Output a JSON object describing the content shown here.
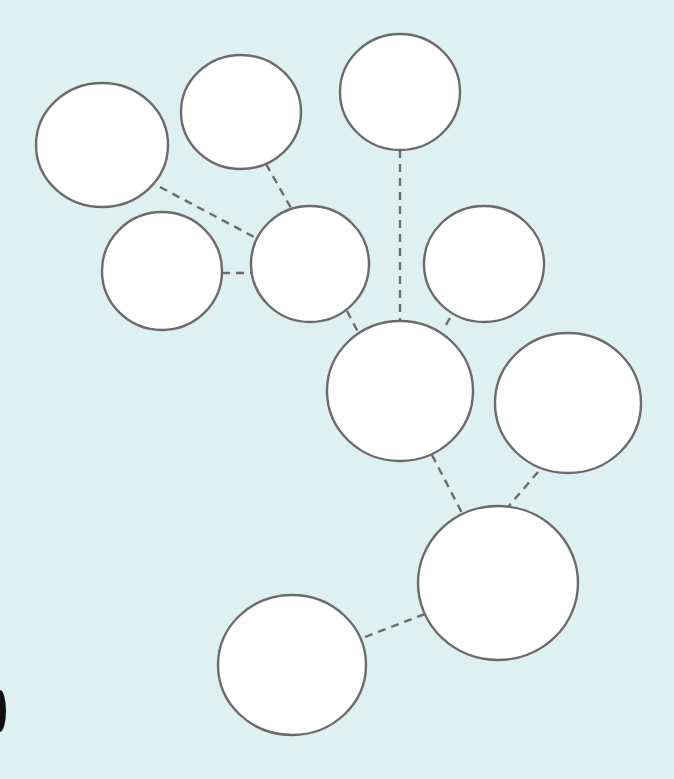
{
  "diagram": {
    "type": "concept-web",
    "background_color": "#dff0f0",
    "node_fill": "#ffffff",
    "stroke_color": "#6b6b6b",
    "nodes": [
      {
        "id": "n1",
        "label": "",
        "cx": 102,
        "cy": 145,
        "rx": 66,
        "ry": 62
      },
      {
        "id": "n2",
        "label": "",
        "cx": 241,
        "cy": 112,
        "rx": 60,
        "ry": 57
      },
      {
        "id": "n3",
        "label": "",
        "cx": 400,
        "cy": 92,
        "rx": 60,
        "ry": 58
      },
      {
        "id": "n4",
        "label": "",
        "cx": 162,
        "cy": 271,
        "rx": 60,
        "ry": 59
      },
      {
        "id": "n5",
        "label": "",
        "cx": 310,
        "cy": 264,
        "rx": 59,
        "ry": 58
      },
      {
        "id": "n6",
        "label": "",
        "cx": 484,
        "cy": 264,
        "rx": 60,
        "ry": 58
      },
      {
        "id": "n7",
        "label": "",
        "cx": 400,
        "cy": 391,
        "rx": 73,
        "ry": 70
      },
      {
        "id": "n8",
        "label": "",
        "cx": 568,
        "cy": 403,
        "rx": 73,
        "ry": 70
      },
      {
        "id": "n9",
        "label": "",
        "cx": 498,
        "cy": 583,
        "rx": 80,
        "ry": 77
      },
      {
        "id": "n10",
        "label": "",
        "cx": 292,
        "cy": 665,
        "rx": 74,
        "ry": 70
      }
    ],
    "edges": [
      {
        "from": "n1",
        "to": "n5",
        "x1": 160,
        "y1": 187,
        "x2": 256,
        "y2": 238,
        "style": "dashed"
      },
      {
        "from": "n2",
        "to": "n5",
        "x1": 266,
        "y1": 164,
        "x2": 291,
        "y2": 208,
        "style": "dashed"
      },
      {
        "from": "n4",
        "to": "n5",
        "x1": 222,
        "y1": 273,
        "x2": 251,
        "y2": 273,
        "style": "dashed"
      },
      {
        "from": "n3",
        "to": "n7",
        "x1": 400,
        "y1": 150,
        "x2": 400,
        "y2": 321,
        "style": "dashed"
      },
      {
        "from": "n5",
        "to": "n7",
        "x1": 347,
        "y1": 311,
        "x2": 358,
        "y2": 332,
        "style": "dashed"
      },
      {
        "from": "n6",
        "to": "n7",
        "x1": 450,
        "y1": 318,
        "x2": 443,
        "y2": 330,
        "style": "dashed"
      },
      {
        "from": "n7",
        "to": "n9",
        "x1": 432,
        "y1": 455,
        "x2": 462,
        "y2": 513,
        "style": "dashed"
      },
      {
        "from": "n8",
        "to": "n9",
        "x1": 538,
        "y1": 472,
        "x2": 508,
        "y2": 507,
        "style": "dashed"
      },
      {
        "from": "n10",
        "to": "n9",
        "x1": 365,
        "y1": 637,
        "x2": 425,
        "y2": 614,
        "style": "dashed"
      }
    ],
    "edge_artifact": {
      "x": 0,
      "y": 690,
      "width": 6,
      "height": 42,
      "color": "#111111"
    }
  }
}
